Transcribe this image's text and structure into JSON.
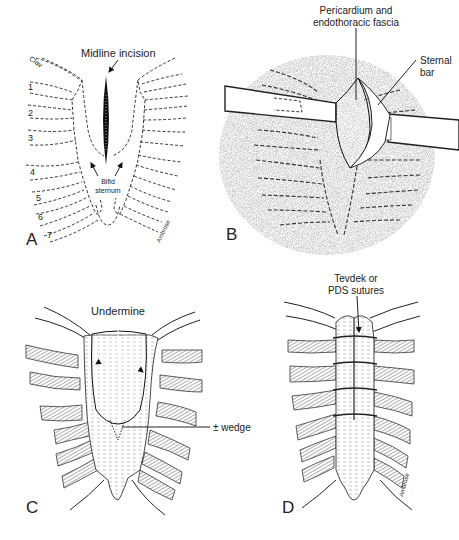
{
  "figure": {
    "colors": {
      "ink": "#222222",
      "stipple": "#b8b8b8",
      "background": "#ffffff"
    },
    "panels": [
      {
        "id": "A",
        "letter": "A",
        "labels": {
          "incision": "Midline incision",
          "bifid_line1": "Bifid",
          "bifid_line2": "sternum",
          "clavicle": "Clav",
          "signature": "Ambrose"
        },
        "rib_numbers": [
          "1",
          "2",
          "3",
          "4",
          "5",
          "6",
          "7"
        ]
      },
      {
        "id": "B",
        "letter": "B",
        "labels": {
          "pericardium_line1": "Pericardium and",
          "pericardium_line2": "endothoracic fascia",
          "sternal_line1": "Sternal",
          "sternal_line2": "bar"
        }
      },
      {
        "id": "C",
        "letter": "C",
        "labels": {
          "undermine": "Undermine",
          "wedge": "± wedge"
        }
      },
      {
        "id": "D",
        "letter": "D",
        "labels": {
          "sutures_line1": "Tevdek or",
          "sutures_line2": "PDS sutures",
          "signature": "Ambrose"
        }
      }
    ]
  }
}
